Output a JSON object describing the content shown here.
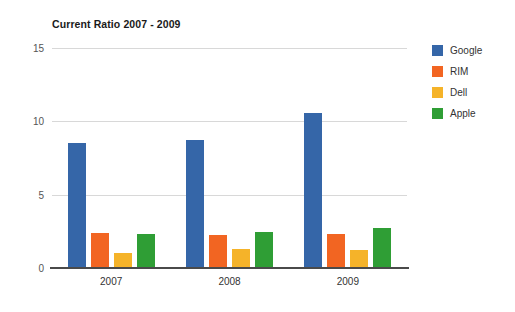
{
  "chart_data": {
    "type": "bar",
    "title": "Current Ratio 2007 - 2009",
    "xlabel": "",
    "ylabel": "",
    "categories": [
      "2007",
      "2008",
      "2009"
    ],
    "series": [
      {
        "name": "Google",
        "color": "#3566a8",
        "values": [
          8.5,
          8.75,
          10.6
        ]
      },
      {
        "name": "RIM",
        "color": "#f26522",
        "values": [
          2.4,
          2.25,
          2.35
        ]
      },
      {
        "name": "Dell",
        "color": "#f5b329",
        "values": [
          1.0,
          1.3,
          1.25
        ]
      },
      {
        "name": "Apple",
        "color": "#2f9e35",
        "values": [
          2.35,
          2.45,
          2.75
        ]
      }
    ],
    "ylim": [
      0,
      15
    ],
    "yticks": [
      0,
      5,
      10,
      15
    ],
    "ytick_labels": [
      "0",
      "5",
      "10",
      "15"
    ],
    "grid": true,
    "legend_position": "right",
    "background": "#ffffff",
    "gridline_color": "#d8d8d8",
    "axis_color": "#4a4a4a"
  }
}
